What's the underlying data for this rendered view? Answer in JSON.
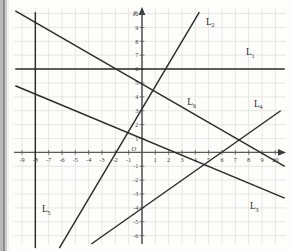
{
  "figure": {
    "background_color": "#fdfdfc",
    "grid_color": "#d8d8d4",
    "axis_color": "#5a5a5a",
    "line_color": "#2b2b2b"
  },
  "axes": {
    "x_axis_name": "x",
    "y_axis_name": "y",
    "origin_label": "O",
    "x_min": -9,
    "x_max": 10,
    "y_min": -6,
    "y_max": 10,
    "x_ticks": [
      "-9",
      "-8",
      "-7",
      "-6",
      "-5",
      "-4",
      "-3",
      "-2",
      "-1",
      "1",
      "2",
      "3",
      "4",
      "5",
      "6",
      "7",
      "8",
      "9",
      "10"
    ],
    "y_ticks": [
      "10",
      "9",
      "8",
      "7",
      "6",
      "5",
      "4",
      "3",
      "2",
      "1",
      "-1",
      "-2",
      "-3",
      "-4",
      "-5",
      "-6"
    ],
    "grid": true
  },
  "chart_data": {
    "type": "line",
    "xlabel": "x",
    "ylabel": "y",
    "xlim": [
      -9.6,
      10.8
    ],
    "ylim": [
      -6.6,
      10.4
    ],
    "grid": true,
    "legend": "inline-labels",
    "series": [
      {
        "name": "L1",
        "label": "L",
        "subscript": "1",
        "description": "horizontal line y = 6",
        "equation": "y = 6",
        "slope": 0,
        "intercept": 6,
        "points": [
          [
            -9.5,
            6
          ],
          [
            10.7,
            6
          ]
        ],
        "label_position": [
          7.8,
          7.0
        ]
      },
      {
        "name": "L2",
        "label": "L",
        "subscript": "2",
        "description": "steep rising line through (0, 5.5)",
        "equation": "y = 2x + 5.5",
        "slope": 2,
        "intercept": 5.5,
        "points": [
          [
            -6.2,
            -6.9
          ],
          [
            4.3,
            10.1
          ]
        ],
        "label_position": [
          4.8,
          9.2
        ]
      },
      {
        "name": "L3",
        "label": "L",
        "subscript": "3",
        "description": "falling line through (0, 1)",
        "equation": "y = -0.4x + 1",
        "slope": -0.4,
        "intercept": 1,
        "points": [
          [
            -9.5,
            4.8
          ],
          [
            10.7,
            -3.3
          ]
        ],
        "label_position": [
          8.1,
          -4.1
        ]
      },
      {
        "name": "L4",
        "label": "L",
        "subscript": "4",
        "description": "rising line through (0, -4)",
        "equation": "y = 0.67x - 4",
        "slope": 0.67,
        "intercept": -4,
        "points": [
          [
            -3.8,
            -6.6
          ],
          [
            10.4,
            3.0
          ]
        ],
        "label_position": [
          8.4,
          3.3
        ]
      },
      {
        "name": "L5",
        "label": "L",
        "subscript": "5",
        "description": "vertical line x = -8",
        "equation": "x = -8",
        "points": [
          [
            -8,
            10.1
          ],
          [
            -8,
            -6.9
          ]
        ],
        "label_position": [
          -7.5,
          -4.3
        ]
      },
      {
        "name": "L6",
        "label": "L",
        "subscript": "6",
        "description": "falling line through (0, 5)",
        "equation": "y = -0.55x + 5",
        "slope": -0.55,
        "intercept": 5,
        "points": [
          [
            -9.5,
            10.2
          ],
          [
            10.7,
            -1.0
          ]
        ],
        "label_position": [
          3.4,
          3.4
        ]
      }
    ],
    "intersections_note": "Lines cross the y-axis at y = 6, 5.5, 5, 1 and -4; L5 is vertical at x = -8."
  }
}
